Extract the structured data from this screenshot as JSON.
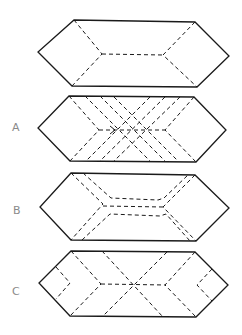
{
  "figure": {
    "type": "folding-diagram",
    "shape": "elongated hexagon",
    "panels": [
      {
        "id": "top",
        "label": ""
      },
      {
        "id": "A",
        "label": "A"
      },
      {
        "id": "B",
        "label": "B"
      },
      {
        "id": "C",
        "label": "C"
      }
    ]
  },
  "colors": {
    "line": "#1a1a1a",
    "label": "#8a8a8a",
    "background": "#ffffff"
  }
}
